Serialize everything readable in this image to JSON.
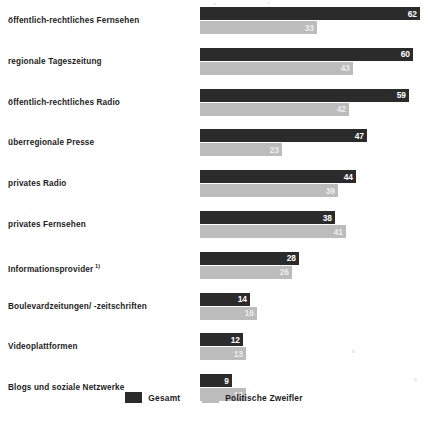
{
  "chart_data": {
    "type": "bar",
    "orientation": "horizontal",
    "title": "",
    "subtitle": "",
    "xlabel": "",
    "ylabel": "",
    "xlim": [
      0,
      62
    ],
    "grid": false,
    "legend_position": "bottom-center",
    "categories": [
      "öffentlich-rechtliches Fernsehen",
      "regionale Tageszeitung",
      "öffentlich-rechtliches Radio",
      "überregionale Presse",
      "privates Radio",
      "privates Fernsehen",
      "Informationsprovider",
      "Boulevardzeitungen/ -zeitschriften",
      "Videoplattformen",
      "Blogs und soziale Netzwerke"
    ],
    "category_footnotes": [
      "",
      "",
      "",
      "",
      "",
      "",
      "1)",
      "",
      "",
      ""
    ],
    "series": [
      {
        "name": "Gesamt",
        "color": "#2b2b2b",
        "values": [
          62,
          60,
          59,
          47,
          44,
          38,
          28,
          14,
          12,
          9
        ]
      },
      {
        "name": "Politische Zweifler",
        "color": "#bcbcbc",
        "values": [
          33,
          43,
          42,
          23,
          39,
          41,
          26,
          16,
          13,
          13
        ]
      }
    ]
  },
  "legend": {
    "items": [
      {
        "label": "Gesamt",
        "color": "#2b2b2b",
        "swatch": "legend-swatch-total"
      },
      {
        "label": "Politische Zweifler",
        "color": "#bcbcbc",
        "swatch": "legend-swatch-doubt"
      }
    ]
  },
  "colors": {
    "background": "#ffffff",
    "total_bar": "#2b2b2b",
    "doubt_bar": "#bcbcbc",
    "text": "#1c1c1c",
    "value_on_dark": "#ffffff",
    "value_on_light": "#ededed"
  }
}
